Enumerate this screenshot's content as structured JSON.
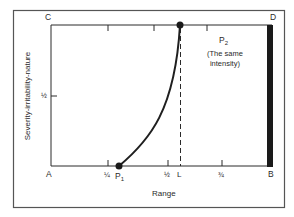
{
  "diagram": {
    "corners": {
      "top_left": "C",
      "top_right": "D",
      "bottom_left": "A",
      "bottom_right": "B"
    },
    "axes": {
      "x_label": "Range",
      "y_label": "Severity-irritability-nature",
      "x_ticks": [
        "¼",
        "½",
        "¾"
      ],
      "y_ticks": [
        "½"
      ],
      "limit_marker": "L"
    },
    "points": {
      "p1": {
        "label": "P",
        "subscript": "1"
      },
      "p2": {
        "label": "P",
        "subscript": "2",
        "note_line1": "(The same",
        "note_line2": "intensity)"
      }
    },
    "colors": {
      "ink": "#2a2a2a",
      "bar": "#1a1a1a",
      "frame": "#555555"
    }
  }
}
